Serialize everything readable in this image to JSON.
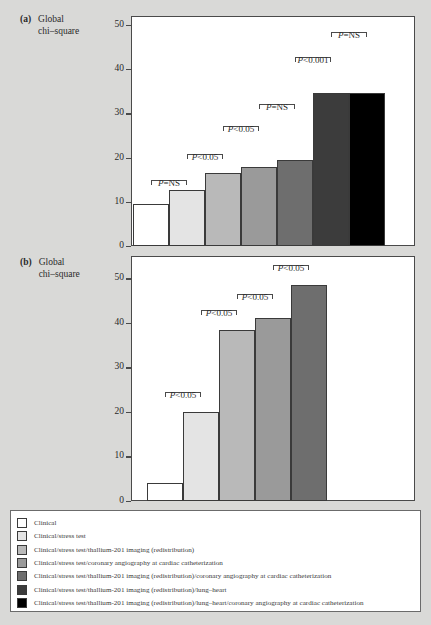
{
  "figure": {
    "background_color": "#d9d9d7",
    "panels": [
      {
        "tag": "(a)",
        "axis_title_line1": "Global",
        "axis_title_line2": "chi–square"
      },
      {
        "tag": "(b)",
        "axis_title_line1": "Global",
        "axis_title_line2": "chi–square"
      }
    ]
  },
  "legend": {
    "items": [
      {
        "label": "Clinical",
        "color": "#ffffff"
      },
      {
        "label": "Clinical/stress test",
        "color": "#e4e4e4"
      },
      {
        "label": "Clinical/stress test/thallium-201 imaging (redistribution)",
        "color": "#b9b9b9"
      },
      {
        "label": "Clinical/stress test/coronary angiography at cardiac catheterization",
        "color": "#9a9a9a"
      },
      {
        "label": "Clinical/stress test/thallium-201 imaging (redistribution)/coronary angiography at cardiac catheterization",
        "color": "#6e6e6e"
      },
      {
        "label": "Clinical/stress test/thallium-201 imaging (redistribution)/lung–heart",
        "color": "#3c3c3c"
      },
      {
        "label": "Clinical/stress test/thallium-201 imaging (redistribution)/lung–heart/coronary angiography at cardiac catheterization",
        "color": "#000000"
      }
    ]
  },
  "chart_data": [
    {
      "type": "bar",
      "panel": "(a)",
      "title": "Global chi-square",
      "xlabel": "",
      "ylabel": "Global chi–square",
      "ylim": [
        0,
        52
      ],
      "yticks": [
        0,
        10,
        20,
        30,
        40,
        50
      ],
      "ytick_labels": [
        "0",
        "10",
        "20",
        "30",
        "40",
        "50"
      ],
      "grid": false,
      "legend_position": "below figure",
      "categories": [
        "Clinical",
        "Clinical/stress test",
        "Clinical/stress test/thallium-201 imaging (redistribution)",
        "Clinical/stress test/coronary angiography at cardiac catheterization",
        "Clinical/stress test/thallium-201 imaging (redistribution)/coronary angiography at cardiac catheterization",
        "Clinical/stress test/thallium-201 imaging (redistribution)/lung–heart",
        "Clinical/stress test/thallium-201 imaging (redistribution)/lung–heart/coronary angiography at cardiac catheterization"
      ],
      "values": [
        9.6,
        12.6,
        16.4,
        17.8,
        19.5,
        34.7,
        34.7
      ],
      "colors": [
        "#ffffff",
        "#e4e4e4",
        "#b9b9b9",
        "#9a9a9a",
        "#6e6e6e",
        "#3c3c3c",
        "#000000"
      ],
      "annotations": [
        {
          "label": "P=NS",
          "from_bar": 0,
          "to_bar": 1,
          "y": 15.0
        },
        {
          "label": "P<0.05",
          "from_bar": 1,
          "to_bar": 2,
          "y": 20.7
        },
        {
          "label": "P<0.05",
          "from_bar": 2,
          "to_bar": 3,
          "y": 27.2
        },
        {
          "label": "P=NS",
          "from_bar": 3,
          "to_bar": 4,
          "y": 32.0
        },
        {
          "label": "P<0.001",
          "from_bar": 4,
          "to_bar": 5,
          "y": 42.8
        },
        {
          "label": "P=NS",
          "from_bar": 5,
          "to_bar": 6,
          "y": 48.3
        }
      ]
    },
    {
      "type": "bar",
      "panel": "(b)",
      "title": "Global chi-square",
      "xlabel": "",
      "ylabel": "Global chi–square",
      "ylim": [
        0,
        55
      ],
      "yticks": [
        0,
        10,
        20,
        30,
        40,
        50
      ],
      "ytick_labels": [
        "0",
        "10",
        "20",
        "30",
        "40",
        "50"
      ],
      "grid": false,
      "legend_position": "below figure",
      "categories": [
        "Clinical",
        "Clinical/stress test",
        "Clinical/stress test/thallium-201 imaging (redistribution)",
        "Clinical/stress test/coronary angiography at cardiac catheterization",
        "Clinical/stress test/thallium-201 imaging (redistribution)/coronary angiography at cardiac catheterization"
      ],
      "values": [
        4.0,
        20.0,
        38.5,
        41.0,
        48.5
      ],
      "colors": [
        "#ffffff",
        "#e4e4e4",
        "#b9b9b9",
        "#9a9a9a",
        "#6e6e6e"
      ],
      "annotations": [
        {
          "label": "P<0.05",
          "from_bar": 0,
          "to_bar": 1,
          "y": 24.5
        },
        {
          "label": "P<0.05",
          "from_bar": 1,
          "to_bar": 2,
          "y": 42.8
        },
        {
          "label": "P<0.05",
          "from_bar": 2,
          "to_bar": 3,
          "y": 46.5
        },
        {
          "label": "P<0.05",
          "from_bar": 3,
          "to_bar": 4,
          "y": 53.0
        }
      ]
    }
  ]
}
